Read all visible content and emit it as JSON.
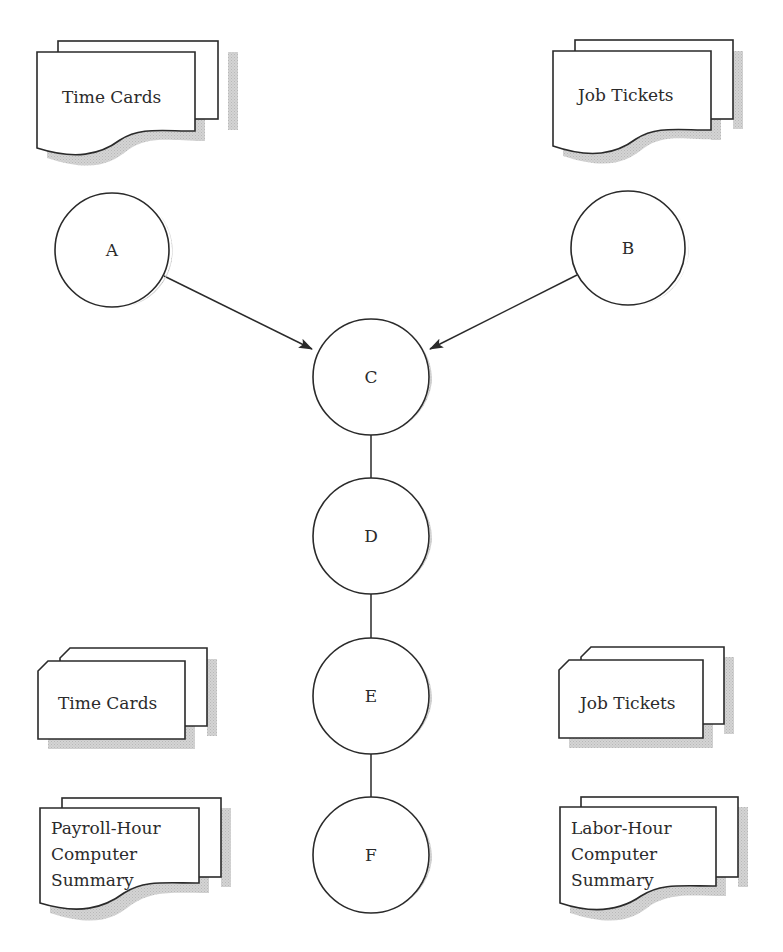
{
  "diagram": {
    "type": "system flowchart",
    "colors": {
      "stroke": "#2a2a2a",
      "shadow": "#c8c8c8",
      "fill": "#ffffff",
      "text": "#2b2b2b"
    },
    "documents": [
      {
        "id": "doc-top-left",
        "symbol": "document",
        "lines": [
          "Time Cards"
        ]
      },
      {
        "id": "doc-top-right",
        "symbol": "document",
        "lines": [
          "Job Tickets"
        ]
      },
      {
        "id": "doc-bottom-left",
        "symbol": "document",
        "lines": [
          "Payroll-Hour",
          "Computer",
          "Summary"
        ]
      },
      {
        "id": "doc-bottom-right",
        "symbol": "document",
        "lines": [
          "Labor-Hour",
          "Computer",
          "Summary"
        ]
      }
    ],
    "cards": [
      {
        "id": "card-left",
        "symbol": "punched-card",
        "label": "Time Cards"
      },
      {
        "id": "card-right",
        "symbol": "punched-card",
        "label": "Job Tickets"
      }
    ],
    "nodes": [
      {
        "id": "A",
        "label": "A"
      },
      {
        "id": "B",
        "label": "B"
      },
      {
        "id": "C",
        "label": "C"
      },
      {
        "id": "D",
        "label": "D"
      },
      {
        "id": "E",
        "label": "E"
      },
      {
        "id": "F",
        "label": "F"
      }
    ],
    "edges": [
      {
        "from": "A",
        "to": "C",
        "arrow": true
      },
      {
        "from": "B",
        "to": "C",
        "arrow": true
      },
      {
        "from": "C",
        "to": "D",
        "arrow": false
      },
      {
        "from": "D",
        "to": "E",
        "arrow": false
      },
      {
        "from": "E",
        "to": "F",
        "arrow": false
      }
    ]
  }
}
